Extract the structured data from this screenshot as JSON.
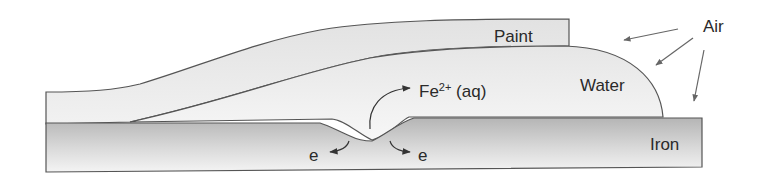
{
  "diagram": {
    "type": "corrosion-cross-section",
    "colors": {
      "outline": "#555555",
      "iron_top": "#b8b8b8",
      "iron_bottom": "#f2f2f2",
      "water_fill": "#ececec",
      "paint_fill": "#e8e8e8",
      "arrow": "#333333",
      "text": "#2a2a2a"
    },
    "labels": {
      "paint": "Paint",
      "water": "Water",
      "iron": "Iron",
      "air": "Air",
      "fe_ion_main": "Fe",
      "fe_ion_charge": "2+",
      "fe_ion_state": " (aq)",
      "electron_left": "e",
      "electron_right": "e"
    },
    "layers": [
      {
        "name": "Iron",
        "position": "bottom"
      },
      {
        "name": "Water",
        "position": "droplet between paint and iron, edge exposed to air"
      },
      {
        "name": "Paint",
        "position": "top coating, lifted over water"
      }
    ],
    "reactions": [
      {
        "species": "Fe2+ (aq)",
        "direction": "from pit into water"
      },
      {
        "species": "e",
        "direction": "into iron, left of pit"
      },
      {
        "species": "e",
        "direction": "into iron, right of pit"
      }
    ],
    "air_arrows": 3
  }
}
